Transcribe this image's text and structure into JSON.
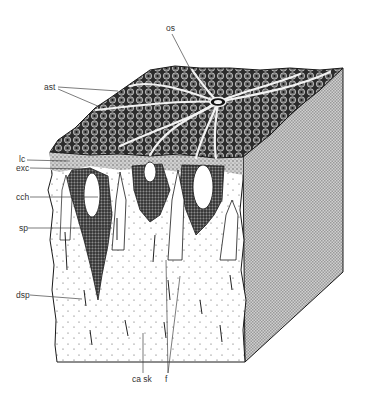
{
  "figure": {
    "labels": [
      {
        "id": "os",
        "text": "os",
        "x": 166,
        "y": 31,
        "target": [
          197,
          82
        ]
      },
      {
        "id": "ast",
        "text": "ast",
        "x": 46,
        "y": 90,
        "targets": [
          [
            118,
            91
          ],
          [
            100,
            107
          ]
        ]
      },
      {
        "id": "lc",
        "text": "lc",
        "x": 19,
        "y": 161,
        "target": [
          68,
          161
        ]
      },
      {
        "id": "exc",
        "text": "exc",
        "x": 17,
        "y": 170,
        "target": [
          88,
          170
        ]
      },
      {
        "id": "cch",
        "text": "cch",
        "x": 17,
        "y": 199,
        "target": [
          98,
          198
        ]
      },
      {
        "id": "sp",
        "text": "sp",
        "x": 19,
        "y": 230,
        "target": [
          112,
          228
        ]
      },
      {
        "id": "dsp",
        "text": "dsp",
        "x": 17,
        "y": 297,
        "target": [
          82,
          300
        ]
      },
      {
        "id": "ca-sk",
        "text": "ca sk",
        "x": 132,
        "y": 381,
        "target": [
          143,
          333
        ]
      },
      {
        "id": "f",
        "text": "f",
        "x": 166,
        "y": 381,
        "targets": [
          [
            166,
            260
          ],
          [
            180,
            276
          ]
        ]
      }
    ]
  },
  "colors": {
    "ink": "#1a1a1a",
    "label_text": "#333333",
    "right_face": "#bdbdbd",
    "top_face": "#3a3a3a",
    "skeleton": "#ffffff"
  }
}
